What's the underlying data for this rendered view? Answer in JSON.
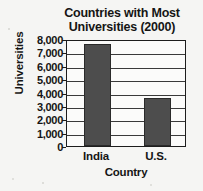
{
  "chart_data": {
    "type": "bar",
    "title": "Countries with Most Universities (2000)",
    "title_line1": "Countries with Most",
    "title_line2": "Universities (2000)",
    "xlabel": "Country",
    "ylabel": "Universities",
    "categories": [
      "India",
      "U.S."
    ],
    "values": [
      7600,
      3600
    ],
    "ylim": [
      0,
      8000
    ],
    "ytick_labels": [
      "8,000",
      "7,000",
      "6,000",
      "5,000",
      "4,000",
      "3,000",
      "2,000",
      "1,000",
      "0"
    ],
    "ytick_values": [
      8000,
      7000,
      6000,
      5000,
      4000,
      3000,
      2000,
      1000,
      0
    ],
    "grid": true,
    "legend": "none",
    "bar_color": "#4d4d4d",
    "bar_border_color": "#2a2a2a",
    "axis_color": "#1d1d1d",
    "background_color": "#f5f5f3"
  }
}
